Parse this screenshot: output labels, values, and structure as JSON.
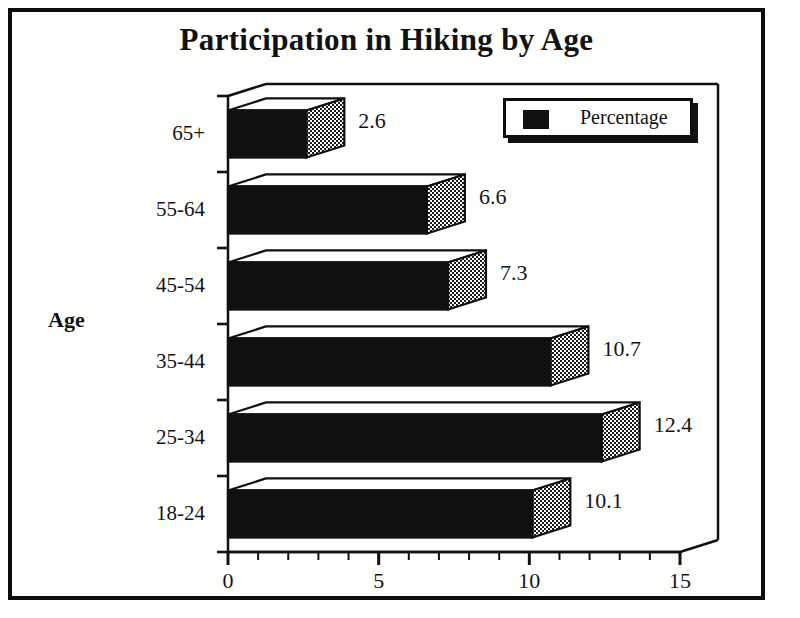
{
  "frame": {
    "border_color": "#0d0d0d"
  },
  "chart_data": {
    "type": "bar",
    "orientation": "horizontal",
    "title": "Participation in Hiking by Age",
    "xlabel": "",
    "ylabel": "Age",
    "categories": [
      "18-24",
      "25-34",
      "35-44",
      "45-54",
      "55-64",
      "65+"
    ],
    "values": [
      10.1,
      12.4,
      10.7,
      7.3,
      6.6,
      2.6
    ],
    "data_labels": [
      "10.1",
      "12.4",
      "10.7",
      "7.3",
      "6.6",
      "2.6"
    ],
    "series": [
      {
        "name": "Percentage",
        "values": [
          10.1,
          12.4,
          10.7,
          7.3,
          6.6,
          2.6
        ],
        "color": "#101010"
      }
    ],
    "xlim": [
      0,
      15
    ],
    "xticks": [
      0,
      5,
      10,
      15
    ],
    "xtick_labels": [
      "0",
      "5",
      "10",
      "15"
    ],
    "minor_tick_interval": 1,
    "grid": false,
    "legend": {
      "position": "top-right",
      "entries": [
        {
          "label": "Percentage",
          "swatch_color": "#101010",
          "swatch_icon": "filled-square-icon"
        }
      ]
    },
    "style": {
      "bar_front_color": "#101010",
      "bar_top_color": "#ffffff",
      "bar_end_cap_pattern": "checker-dither",
      "three_d": true
    }
  },
  "legend": {
    "label": "Percentage"
  },
  "axes": {
    "y_title": "Age"
  }
}
